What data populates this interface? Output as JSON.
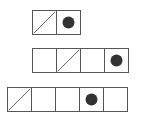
{
  "diagram": {
    "colors": {
      "line": "#555555",
      "dot": "#333333",
      "background": "#ffffff"
    },
    "rows": [
      {
        "left": 32,
        "top": 10,
        "cells": [
          "slash",
          "dot"
        ]
      },
      {
        "left": 32,
        "top": 48,
        "cells": [
          "empty",
          "slash",
          "empty",
          "dot"
        ]
      },
      {
        "left": 7,
        "top": 87,
        "cells": [
          "slash",
          "empty",
          "empty",
          "dot",
          "empty"
        ]
      }
    ]
  }
}
